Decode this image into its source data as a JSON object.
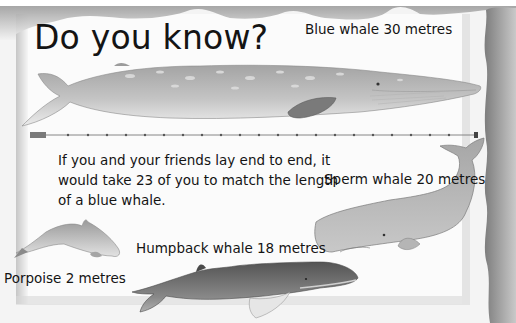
{
  "page": {
    "title": "Do you know?",
    "fact_lines": [
      "If you and your friends lay end to end, it",
      "would take 23 of you to match the length",
      "of a blue whale."
    ],
    "whales": [
      {
        "name": "blue-whale",
        "label": "Blue whale 30 metres"
      },
      {
        "name": "sperm-whale",
        "label": "Sperm whale 20 metres"
      },
      {
        "name": "humpback-whale",
        "label": "Humpback whale 18 metres"
      },
      {
        "name": "porpoise",
        "label": "Porpoise 2 metres"
      }
    ],
    "scale_line": {
      "people_count": 23,
      "icon": "person-lying-icon"
    },
    "colors": {
      "paper": "#f4f4f4",
      "panel": "#fbfbfb",
      "wave_shade": "#a8a8a8",
      "whale_light": "#b9b9b9",
      "whale_mid": "#9a9a9a",
      "whale_dark": "#6f6f6f",
      "text": "#141414"
    }
  }
}
